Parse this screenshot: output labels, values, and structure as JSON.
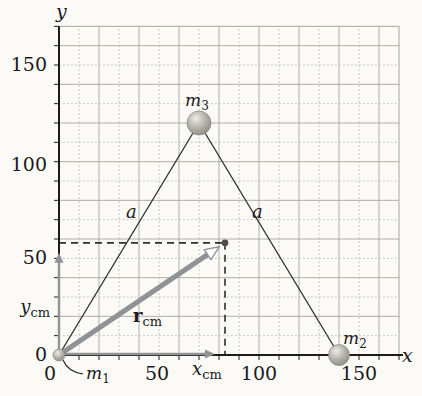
{
  "figure": {
    "canvas": {
      "w": 422,
      "h": 396
    },
    "colors": {
      "bg": "#fbfaf7",
      "grid": "#a6a69e",
      "grid_minor": "#b7b7af",
      "axis": "#1b1b1b",
      "text": "#1b1b1b",
      "gray_arrow": "#8f9396",
      "dash": "#2e2e2e",
      "com_dot": "#4e4e4e",
      "ball_edge": "#85857d"
    },
    "grid": {
      "origin_px": [
        59,
        355
      ],
      "unit_px": [
        2.0,
        1.9333
      ],
      "step_units": 10,
      "cols": 17,
      "rows": 17
    },
    "axes": {
      "x_title": {
        "parts": [
          {
            "t": "x",
            "i": 1,
            "s": 19
          }
        ],
        "px": [
          402,
          362
        ]
      },
      "y_title": {
        "parts": [
          {
            "t": "y",
            "i": 1,
            "s": 19
          }
        ],
        "px": [
          56,
          18
        ]
      },
      "x_ticks": [
        {
          "v": 0,
          "t": "0",
          "px": [
            50,
            380
          ]
        },
        {
          "v": 50,
          "t": "50",
          "px": [
            157,
            380
          ]
        },
        {
          "v": 100,
          "t": "100",
          "px": [
            259,
            380
          ]
        },
        {
          "v": 150,
          "t": "150",
          "px": [
            359,
            380
          ]
        }
      ],
      "y_ticks": [
        {
          "v": 0,
          "t": "0",
          "px": [
            47,
            361
          ]
        },
        {
          "v": 50,
          "t": "50",
          "px": [
            47,
            264
          ]
        },
        {
          "v": 100,
          "t": "100",
          "px": [
            47,
            171
          ]
        },
        {
          "v": 150,
          "t": "150",
          "px": [
            47,
            71
          ]
        }
      ]
    },
    "masses": [
      {
        "id": "m1",
        "pos": [
          0,
          0
        ],
        "r": 6,
        "label": {
          "parts": [
            {
              "t": "m",
              "i": 1,
              "s": 17
            },
            {
              "t": "1",
              "s": 12,
              "dy": 4
            }
          ],
          "px": [
            86,
            379
          ]
        },
        "leader_path": "M 63 360 Q 68 372 83 374"
      },
      {
        "id": "m2",
        "pos": [
          140,
          0
        ],
        "r": 10.5,
        "label": {
          "parts": [
            {
              "t": "m",
              "i": 1,
              "s": 17
            },
            {
              "t": "2",
              "s": 12,
              "dy": 4
            }
          ],
          "px": [
            343,
            344
          ]
        }
      },
      {
        "id": "m3",
        "pos": [
          70,
          120
        ],
        "r": 12,
        "label": {
          "parts": [
            {
              "t": "m",
              "i": 1,
              "s": 17
            },
            {
              "t": "3",
              "s": 12,
              "dy": 4
            }
          ],
          "px": [
            185,
            106
          ]
        }
      }
    ],
    "triangle_sides": [
      {
        "from": 0,
        "to": 2,
        "label": {
          "parts": [
            {
              "t": "a",
              "i": 1,
              "s": 18
            }
          ],
          "px": [
            126,
            218
          ]
        }
      },
      {
        "from": 2,
        "to": 1,
        "label": {
          "parts": [
            {
              "t": "a",
              "i": 1,
              "s": 18
            }
          ],
          "px": [
            252,
            218
          ]
        }
      }
    ],
    "com": {
      "pos": [
        83,
        58
      ],
      "r_label": {
        "parts": [
          {
            "t": "r",
            "b": 1,
            "s": 18
          },
          {
            "t": "cm",
            "s": 13,
            "dy": 4
          }
        ],
        "px": [
          133,
          322
        ]
      },
      "x_label": {
        "parts": [
          {
            "t": "x",
            "i": 1,
            "s": 18
          },
          {
            "t": "cm",
            "s": 13,
            "dy": 4
          }
        ],
        "px": [
          192,
          375
        ]
      },
      "y_label": {
        "parts": [
          {
            "t": "y",
            "i": 1,
            "s": 18
          },
          {
            "t": "cm",
            "s": 13,
            "dy": 4
          }
        ],
        "px": [
          50,
          313
        ],
        "anchor": "end"
      }
    }
  },
  "chart_data": {
    "type": "scatter",
    "title": "",
    "xlabel": "x",
    "ylabel": "y",
    "xlim": [
      0,
      172
    ],
    "ylim": [
      0,
      170
    ],
    "x_tick_values": [
      0,
      50,
      100,
      150
    ],
    "y_tick_values": [
      0,
      50,
      100,
      150
    ],
    "grid": true,
    "points": [
      {
        "name": "m1",
        "x": 0,
        "y": 0
      },
      {
        "name": "m2",
        "x": 140,
        "y": 0
      },
      {
        "name": "m3",
        "x": 70,
        "y": 120
      },
      {
        "name": "center_of_mass",
        "x": 83,
        "y": 58
      }
    ],
    "segments": [
      {
        "from": "m1",
        "to": "m3",
        "label": "a"
      },
      {
        "from": "m3",
        "to": "m2",
        "label": "a"
      }
    ],
    "annotations": [
      "r_cm vector from origin to center of mass",
      "x_cm and y_cm component arrows with dashed projection lines"
    ]
  }
}
